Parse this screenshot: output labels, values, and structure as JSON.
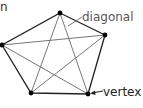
{
  "diagram": {
    "title_fragment": "n",
    "labels": {
      "diagonal": "diagonal",
      "vertex": "vertex"
    },
    "vertices": [
      {
        "id": "top",
        "x": 60,
        "y": 13
      },
      {
        "id": "right",
        "x": 105,
        "y": 35
      },
      {
        "id": "bottom-right",
        "x": 88,
        "y": 94
      },
      {
        "id": "bottom-left",
        "x": 31,
        "y": 93
      },
      {
        "id": "left",
        "x": 2,
        "y": 45
      }
    ],
    "colors": {
      "edge": "#222222",
      "diagonal": "#666666",
      "vertex": "#000000",
      "label_diagonal": "#666666",
      "label_vertex": "#222222"
    }
  }
}
